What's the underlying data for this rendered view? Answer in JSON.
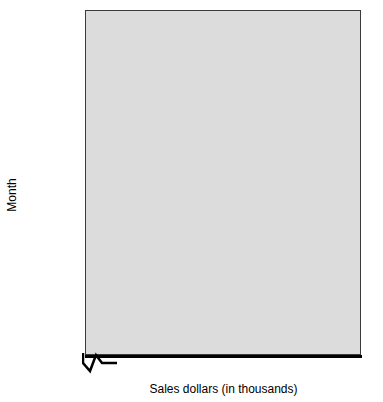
{
  "chart_data": {
    "type": "bar",
    "orientation": "horizontal",
    "title": "",
    "xlabel": "Sales dollars (in thousands)",
    "ylabel": "Month",
    "categories": [
      "January",
      "February",
      "March",
      "April",
      "May",
      "June"
    ],
    "values": [
      38,
      44,
      58,
      51,
      56,
      64
    ],
    "xlim": [
      30,
      70
    ],
    "xticks": [
      0,
      30,
      35,
      40,
      45,
      50,
      55,
      60,
      65,
      70
    ],
    "xtick_labels": [
      "0",
      "30",
      "35",
      "40",
      "45",
      "50",
      "55",
      "60",
      "65",
      "70"
    ],
    "axis_break": true,
    "axis_break_note": "x-axis is broken between 0 and 30",
    "grid": false,
    "legend": null,
    "bar_colors": [
      "#0a0a0a",
      "#0a0a0a",
      "#f2f2f2",
      "#e0e0e0",
      "#9a9a9a",
      "#a8a8a8"
    ],
    "bar_edge_color": "#3a3a3a",
    "plot_background": "#dcdcdc",
    "series": [
      {
        "name": "Sales dollars (in thousands)",
        "points": [
          {
            "category": "January",
            "value": 38
          },
          {
            "category": "February",
            "value": 44
          },
          {
            "category": "March",
            "value": 58
          },
          {
            "category": "April",
            "value": 51
          },
          {
            "category": "May",
            "value": 56
          },
          {
            "category": "June",
            "value": 64
          }
        ]
      }
    ]
  }
}
